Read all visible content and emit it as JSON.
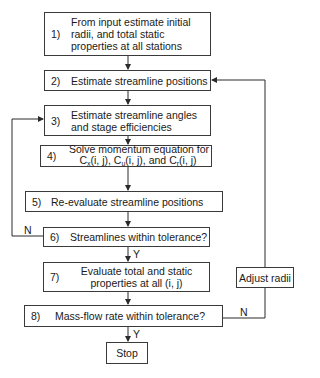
{
  "diagram": {
    "type": "flowchart",
    "steps": [
      {
        "num": "1)",
        "lines": [
          "From input estimate initial",
          "radii, and total static",
          "properties at all stations"
        ]
      },
      {
        "num": "2)",
        "lines": [
          "Estimate streamline positions"
        ]
      },
      {
        "num": "3)",
        "lines": [
          "Estimate streamline angles",
          "and stage efficiencies"
        ]
      },
      {
        "num": "4)",
        "line1": "Solve momentum equation for",
        "c1": "C",
        "s1": "x",
        "t1": "(i, j), ",
        "c2": "C",
        "s2": "u",
        "t2": "(i, j), and ",
        "c3": "C",
        "s3": "r",
        "t3": "(i, j)"
      },
      {
        "num": "5)",
        "lines": [
          "Re-evaluate streamline positions"
        ]
      },
      {
        "num": "6)",
        "lines": [
          "Streamlines within tolerance?"
        ]
      },
      {
        "num": "7)",
        "lines": [
          "Evaluate total and static",
          "properties at all (i, j)"
        ]
      },
      {
        "num": "8)",
        "lines": [
          "Mass-flow rate within tolerance?"
        ]
      }
    ],
    "stop": "Stop",
    "adjust": "Adjust radii",
    "labels": {
      "n6": "N",
      "y6": "Y",
      "n8": "N",
      "y8": "Y"
    }
  }
}
